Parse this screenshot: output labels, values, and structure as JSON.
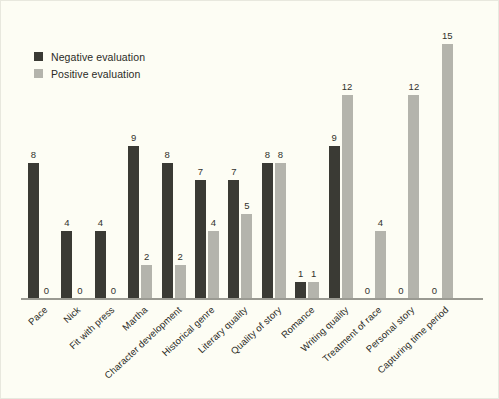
{
  "chart_data": {
    "type": "bar",
    "title": "",
    "subtitle": "",
    "xlabel": "",
    "ylabel": "",
    "ylim": [
      0,
      16
    ],
    "grid": false,
    "legend_position": "top-left",
    "categories": [
      "Pace",
      "Nick",
      "Fit with press",
      "Martha",
      "Character development",
      "Historical genre",
      "Literary quality",
      "Quality of story",
      "Romance",
      "Writing quality",
      "Treatment of race",
      "Personal story",
      "Capturing time period"
    ],
    "series": [
      {
        "name": "Negative evaluation",
        "color": "#3a3a34",
        "values": [
          8,
          4,
          4,
          9,
          8,
          7,
          7,
          8,
          1,
          9,
          0,
          0,
          0
        ]
      },
      {
        "name": "Positive evaluation",
        "color": "#b4b4ac",
        "values": [
          0,
          0,
          0,
          2,
          2,
          4,
          5,
          8,
          1,
          12,
          4,
          12,
          15
        ]
      }
    ]
  },
  "legend": {
    "items": [
      {
        "label": "Negative evaluation",
        "color": "#3a3a34"
      },
      {
        "label": "Positive evaluation",
        "color": "#b4b4ac"
      }
    ]
  },
  "colors": {
    "background": "#fdfdf4",
    "negative": "#3a3a34",
    "positive": "#b4b4ac",
    "axis": "#9a9a92",
    "text": "#2b2b26"
  }
}
